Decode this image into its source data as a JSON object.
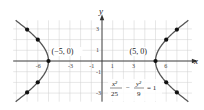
{
  "chart_data": {
    "type": "line",
    "title": "",
    "equation": {
      "x_num": "x²",
      "x_den": "25",
      "minus": "−",
      "y_num": "y²",
      "y_den": "9",
      "rhs": "= 1"
    },
    "xlabel": "x",
    "ylabel": "y",
    "xlim": [
      -8.3,
      8.4
    ],
    "ylim": [
      -3.8,
      3.8
    ],
    "grid": true,
    "x_ticks": [
      {
        "value": -6,
        "label": "-6"
      },
      {
        "value": -3,
        "label": "-3"
      },
      {
        "value": -1,
        "label": "-1"
      },
      {
        "value": 1,
        "label": "1"
      },
      {
        "value": 3,
        "label": "3"
      },
      {
        "value": 6,
        "label": "6"
      }
    ],
    "y_ticks": [
      {
        "value": 3,
        "label": "3"
      },
      {
        "value": 1,
        "label": "1"
      },
      {
        "value": -1,
        "label": "-1"
      },
      {
        "value": -3,
        "label": "-3"
      }
    ],
    "curve": {
      "a": 5,
      "b": 3,
      "color": "#555555"
    },
    "points": [
      {
        "x": -5,
        "y": 0
      },
      {
        "x": -6,
        "y": 1.99
      },
      {
        "x": -6,
        "y": -1.99
      },
      {
        "x": -7,
        "y": 2.94
      },
      {
        "x": -7,
        "y": -2.94
      },
      {
        "x": 5,
        "y": 0
      },
      {
        "x": 6,
        "y": 1.99
      },
      {
        "x": 6,
        "y": -1.99
      },
      {
        "x": 7,
        "y": 2.94
      },
      {
        "x": 7,
        "y": -2.94
      }
    ],
    "annotations": [
      {
        "text": "(−5, 0)",
        "anchor_x": -5,
        "anchor_y": 0
      },
      {
        "text": "(5, 0)",
        "anchor_x": 5,
        "anchor_y": 0
      }
    ]
  }
}
